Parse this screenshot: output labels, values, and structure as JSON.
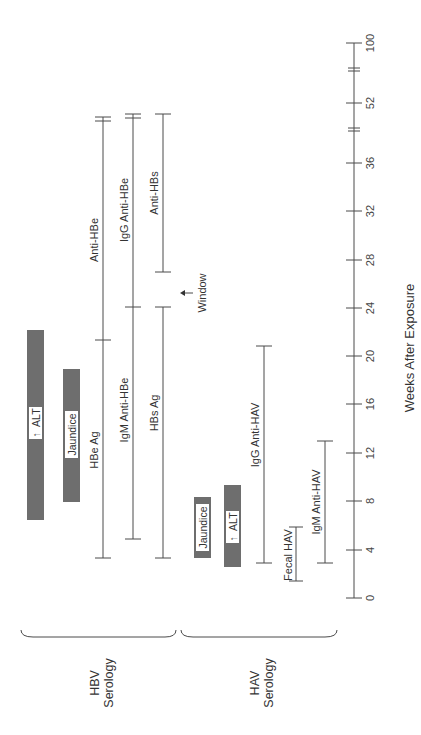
{
  "diagram": {
    "axis": {
      "title": "Weeks After Exposure",
      "ticks": [
        "0",
        "4",
        "8",
        "12",
        "16",
        "20",
        "24",
        "28",
        "32",
        "36",
        "52",
        "100"
      ],
      "breaks": [
        "between 36 and 52",
        "between 52 and 100"
      ]
    },
    "groups": {
      "hbv": {
        "line1": "HBV",
        "line2": "Serology"
      },
      "hav": {
        "line1": "HAV",
        "line2": "Serology"
      }
    },
    "hbv_bars": {
      "alt": {
        "label": "ALT",
        "arrow": "↑",
        "start_week": 7,
        "end_week": 20
      },
      "jaundice": {
        "label": "Jaundice",
        "start_week": 8,
        "end_week": 19
      }
    },
    "hbv_markers": {
      "hbe_ag": {
        "label": "HBe Ag",
        "start_week": 3.5,
        "end_week": 19
      },
      "anti_hbe": {
        "label": "Anti-HBe",
        "start_week": 19,
        "end_week": "52+"
      },
      "igm_anti_hbe": {
        "label": "IgM Anti-HBe",
        "start_week": 5,
        "end_week": 24
      },
      "igg_anti_hbe": {
        "label": "IgG Anti-HBe",
        "start_week": 24,
        "end_week": "52+"
      },
      "hbs_ag": {
        "label": "HBs Ag",
        "start_week": 3.5,
        "end_week": 24
      },
      "anti_hbs": {
        "label": "Anti-HBs",
        "start_week": 27,
        "end_week": "52+"
      },
      "window": {
        "label": "Window",
        "arrow": "↑"
      }
    },
    "hav_bars": {
      "jaundice": {
        "label": "Jaundice",
        "start_week": 3.5,
        "end_week": 8.5
      },
      "alt": {
        "label": "ALT",
        "arrow": "↑",
        "start_week": 2.5,
        "end_week": 9.5
      }
    },
    "hav_markers": {
      "igg_anti_hav": {
        "label": "IgG Anti-HAV",
        "start_week": 3,
        "end_week": 21
      },
      "fecal_hav": {
        "label": "Fecal HAV",
        "start_week": 1.5,
        "end_week": 6
      },
      "igm_anti_hav": {
        "label": "IgM Anti-HAV",
        "start_week": 3,
        "end_week": 13
      }
    }
  }
}
